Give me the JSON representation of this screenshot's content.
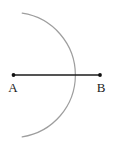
{
  "diagram": {
    "points": {
      "a": {
        "label": "A"
      },
      "b": {
        "label": "B"
      }
    },
    "colors": {
      "segment": "#1b1b1b",
      "dot": "#111111",
      "arc": "#9e9e9e",
      "label": "#1b1b1b",
      "background": "#ffffff"
    }
  }
}
